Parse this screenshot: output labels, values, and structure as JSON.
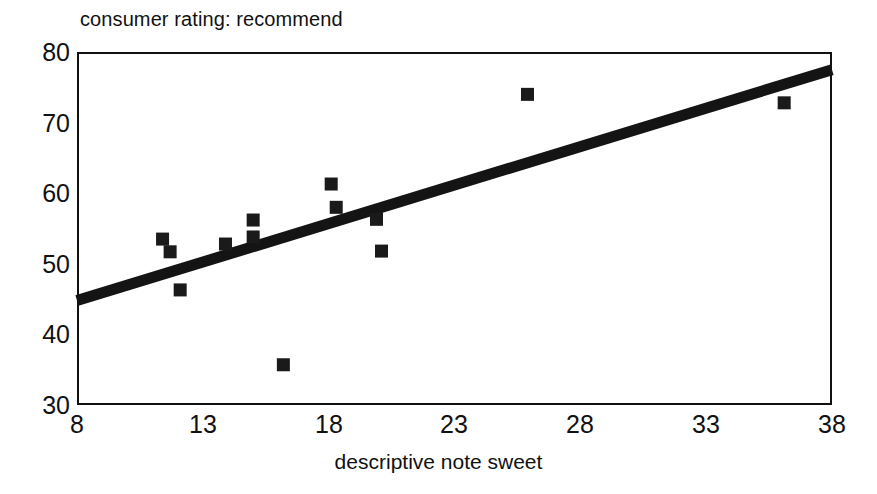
{
  "chart_data": {
    "type": "scatter",
    "title": "consumer rating: recommend",
    "xlabel": "descriptive note sweet",
    "ylabel": "",
    "xlim": [
      8,
      38
    ],
    "ylim": [
      30,
      80
    ],
    "xticks": [
      8,
      13,
      18,
      23,
      28,
      33,
      38
    ],
    "yticks": [
      30,
      40,
      50,
      60,
      70,
      80
    ],
    "grid": false,
    "legend": false,
    "marker_style": "filled-square",
    "marker_color": "#1a1a1a",
    "points": [
      {
        "x": 11.4,
        "y": 53.5
      },
      {
        "x": 11.7,
        "y": 51.7
      },
      {
        "x": 12.1,
        "y": 46.3
      },
      {
        "x": 13.9,
        "y": 52.8
      },
      {
        "x": 15.0,
        "y": 56.2
      },
      {
        "x": 15.0,
        "y": 53.8
      },
      {
        "x": 16.2,
        "y": 35.7
      },
      {
        "x": 18.1,
        "y": 61.3
      },
      {
        "x": 18.3,
        "y": 58.0
      },
      {
        "x": 19.9,
        "y": 56.3
      },
      {
        "x": 20.1,
        "y": 51.8
      },
      {
        "x": 25.9,
        "y": 74.0
      },
      {
        "x": 36.1,
        "y": 72.8
      }
    ],
    "trendline": {
      "type": "linear-fit",
      "color": "#141414",
      "x_start": 8,
      "y_start": 44.8,
      "x_end": 38,
      "y_end": 77.5
    }
  },
  "axis": {
    "x_tick_labels": [
      "8",
      "13",
      "18",
      "23",
      "28",
      "33",
      "38"
    ],
    "y_tick_labels": [
      "80",
      "70",
      "60",
      "50",
      "40",
      "30"
    ]
  }
}
